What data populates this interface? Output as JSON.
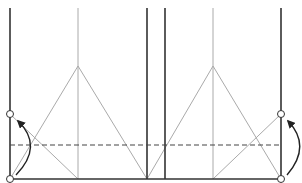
{
  "diagram": {
    "type": "origami-fold-instruction",
    "colors": {
      "edge": "#333333",
      "crease": "#aaaaaa",
      "dashed": "#444444",
      "arrow": "#222222",
      "background": "#ffffff"
    },
    "edges": [
      {
        "id": "left-edge",
        "x1": 10,
        "y1": 8,
        "x2": 10,
        "y2": 179
      },
      {
        "id": "center-left-edge",
        "x1": 147,
        "y1": 8,
        "x2": 147,
        "y2": 179
      },
      {
        "id": "center-right-edge",
        "x1": 165,
        "y1": 8,
        "x2": 165,
        "y2": 179
      },
      {
        "id": "right-edge",
        "x1": 281,
        "y1": 8,
        "x2": 281,
        "y2": 179
      },
      {
        "id": "bottom-edge",
        "x1": 10,
        "y1": 179,
        "x2": 281,
        "y2": 179
      }
    ],
    "creases": [
      {
        "id": "left-center-vertical",
        "x1": 78,
        "y1": 8,
        "x2": 78,
        "y2": 179
      },
      {
        "id": "right-center-vertical",
        "x1": 213,
        "y1": 8,
        "x2": 213,
        "y2": 179
      },
      {
        "id": "left-tri-left-leg",
        "x1": 78,
        "y1": 66,
        "x2": 10,
        "y2": 179
      },
      {
        "id": "left-tri-right-leg",
        "x1": 78,
        "y1": 66,
        "x2": 147,
        "y2": 179
      },
      {
        "id": "right-tri-left-leg",
        "x1": 213,
        "y1": 66,
        "x2": 147,
        "y2": 179
      },
      {
        "id": "right-tri-right-leg",
        "x1": 213,
        "y1": 66,
        "x2": 281,
        "y2": 179
      },
      {
        "id": "left-diagonal",
        "x1": 10,
        "y1": 114,
        "x2": 78,
        "y2": 179
      },
      {
        "id": "right-diagonal",
        "x1": 281,
        "y1": 114,
        "x2": 213,
        "y2": 179
      }
    ],
    "valley_fold": {
      "x1": 10,
      "y1": 145,
      "x2": 281,
      "y2": 145
    },
    "points": [
      {
        "id": "left-target",
        "cx": 10,
        "cy": 114
      },
      {
        "id": "left-origin",
        "cx": 10,
        "cy": 179
      },
      {
        "id": "right-target",
        "cx": 281,
        "cy": 114
      },
      {
        "id": "right-origin",
        "cx": 281,
        "cy": 179
      }
    ],
    "arrows": [
      {
        "id": "left-fold-arrow",
        "path": "M 16 175 Q 44 146 18 121"
      },
      {
        "id": "right-fold-arrow",
        "path": "M 287 175 Q 312 146 288 121"
      }
    ]
  }
}
